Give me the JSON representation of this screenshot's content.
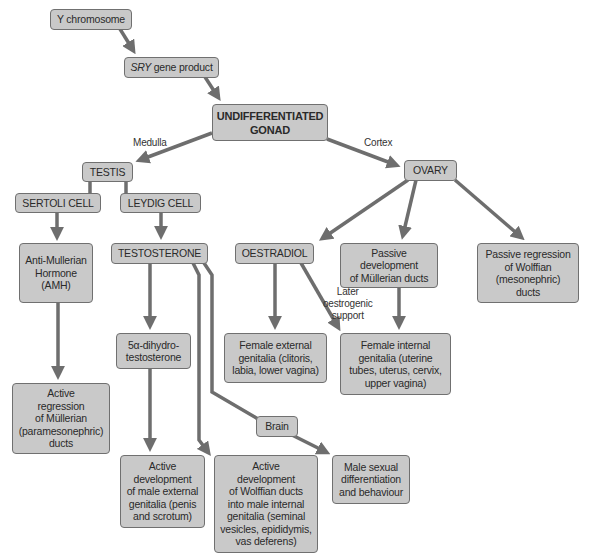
{
  "diagram": {
    "colors": {
      "box_fill": "#c9c9c9",
      "box_border": "#707070",
      "arrow": "#6e6e6e",
      "text": "#2a2a2a"
    },
    "nodes": {
      "y_chromosome": "Y chromosome",
      "sry_italic": "SRY",
      "sry_rest": " gene product",
      "undifferentiated_gonad": "UNDIFFERENTIATED\nGONAD",
      "testis": "TESTIS",
      "ovary": "OVARY",
      "sertoli_cell": "SERTOLI CELL",
      "leydig_cell": "LEYDIG CELL",
      "amh": "Anti-Mullerian\nHormone\n(AMH)",
      "testosterone": "TESTOSTERONE",
      "dht": "5α-dihydro-\ntestosterone",
      "active_regression_mullerian": "Active\nregression\nof Müllerian\n(paramesonephric)\nducts",
      "oestradiol": "OESTRADIOL",
      "passive_dev_mullerian": "Passive development\nof Müllerian ducts",
      "passive_regression_wolffian": "Passive regression\nof Wolffian\n(mesonephric)\nducts",
      "female_external": "Female external\ngenitalia (clitoris,\nlabia, lower vagina)",
      "female_internal": "Female internal\ngenitalia (uterine\ntubes, uterus, cervix,\nupper vagina)",
      "brain": "Brain",
      "active_male_external": "Active\ndevelopment\nof male external\ngenitalia (penis\nand scrotum)",
      "active_wolffian": "Active\ndevelopment\nof Wolffian ducts\ninto male internal\ngenitalia (seminal\nvesicles, epididymis,\nvas deferens)",
      "male_sexual_diff": "Male sexual\ndifferentiation\nand behaviour"
    },
    "edge_labels": {
      "medulla": "Medulla",
      "cortex": "Cortex",
      "later_oestrogenic": "Later\noestrogenic\nsupport"
    }
  }
}
